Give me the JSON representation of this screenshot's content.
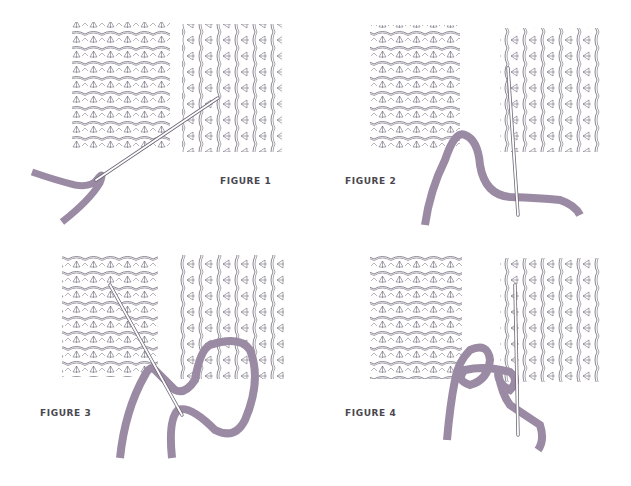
{
  "figures": [
    {
      "id": 1,
      "label": "FIGURE 1",
      "step": "Needle inserted through edge stitch of left piece, angled up into right piece"
    },
    {
      "id": 2,
      "label": "FIGURE 2",
      "step": "Yarn drawn through left piece; needle inserted vertically under bars of right piece"
    },
    {
      "id": 3,
      "label": "FIGURE 3",
      "step": "Yarn looped through right piece; needle inserted diagonally under bars of left piece"
    },
    {
      "id": 4,
      "label": "FIGURE 4",
      "step": "Yarn crossed between pieces; needle inserted vertically under bars of right piece"
    }
  ],
  "colors": {
    "background": "#ffffff",
    "knit_line": "#6e6878",
    "knit_fill": "#ece8f0",
    "yarn": "#9a8aa3",
    "yarn_edge": "#7d6d86",
    "needle": "#ffffff",
    "needle_outline": "#6e6878",
    "label": "#4a4650"
  }
}
